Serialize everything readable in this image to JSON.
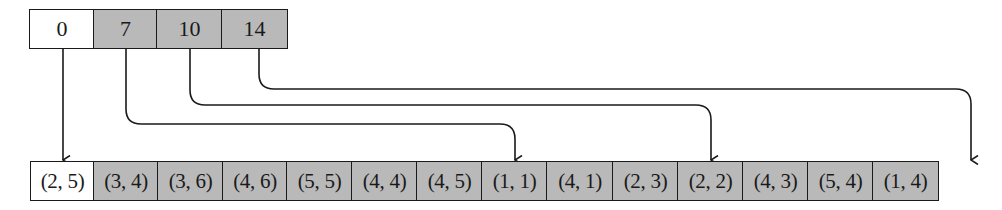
{
  "diagram": {
    "type": "offset-array-to-edge-list",
    "colors": {
      "shaded": "#b9b9b9",
      "plain": "#ffffff",
      "stroke": "#1a1a1a"
    },
    "offsets": {
      "cells": [
        {
          "label": "0",
          "shaded": false
        },
        {
          "label": "7",
          "shaded": true
        },
        {
          "label": "10",
          "shaded": true
        },
        {
          "label": "14",
          "shaded": true
        }
      ]
    },
    "pairs": {
      "cells": [
        {
          "label": "(2, 5)",
          "shaded": false
        },
        {
          "label": "(3, 4)",
          "shaded": true
        },
        {
          "label": "(3, 6)",
          "shaded": true
        },
        {
          "label": "(4, 6)",
          "shaded": true
        },
        {
          "label": "(5, 5)",
          "shaded": true
        },
        {
          "label": "(4, 4)",
          "shaded": true
        },
        {
          "label": "(4, 5)",
          "shaded": true
        },
        {
          "label": "(1, 1)",
          "shaded": true
        },
        {
          "label": "(4, 1)",
          "shaded": true
        },
        {
          "label": "(2, 3)",
          "shaded": true
        },
        {
          "label": "(2, 2)",
          "shaded": true
        },
        {
          "label": "(4, 3)",
          "shaded": true
        },
        {
          "label": "(5, 4)",
          "shaded": true
        },
        {
          "label": "(1, 4)",
          "shaded": true
        }
      ]
    },
    "arrows": [
      {
        "from_offset": "0",
        "to_index": 0
      },
      {
        "from_offset": "7",
        "to_index": 7
      },
      {
        "from_offset": "10",
        "to_index": 10
      },
      {
        "from_offset": "14",
        "to_index": 14
      }
    ]
  }
}
